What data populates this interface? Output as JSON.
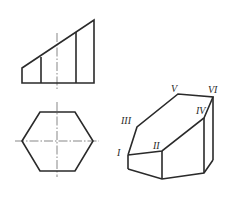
{
  "figure": {
    "front_view": {
      "description": "Front view of hexagonal prism truncated by an inclined plane",
      "vertical_lines": 4
    },
    "top_view": {
      "description": "Top view: regular hexagon with center lines",
      "sides": 6
    },
    "axonometric_view": {
      "description": "Isometric view of truncated hexagonal prism",
      "labels": {
        "I": "I",
        "II": "II",
        "III": "III",
        "IV": "IV",
        "V": "V",
        "VI": "VI"
      }
    },
    "colors": {
      "line": "#2a2a2a",
      "centerline": "#555555",
      "background": "#ffffff"
    }
  }
}
